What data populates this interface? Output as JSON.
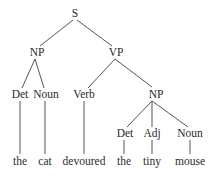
{
  "diagram": {
    "type": "syntax-tree",
    "nodes": {
      "s": {
        "label": "S",
        "x": 75,
        "y": 17
      },
      "np1": {
        "label": "NP",
        "x": 37,
        "y": 56
      },
      "vp": {
        "label": "VP",
        "x": 116,
        "y": 56
      },
      "det1": {
        "label": "Det",
        "x": 20,
        "y": 98
      },
      "noun1": {
        "label": "Noun",
        "x": 46,
        "y": 98
      },
      "verb": {
        "label": "Verb",
        "x": 84,
        "y": 98
      },
      "np2": {
        "label": "NP",
        "x": 156,
        "y": 98
      },
      "det2": {
        "label": "Det",
        "x": 125,
        "y": 137
      },
      "adj": {
        "label": "Adj",
        "x": 152,
        "y": 137
      },
      "noun2": {
        "label": "Noun",
        "x": 190,
        "y": 137
      }
    },
    "words": {
      "w1": {
        "label": "the",
        "x": 20,
        "y": 165
      },
      "w2": {
        "label": "cat",
        "x": 45,
        "y": 165
      },
      "w3": {
        "label": "devoured",
        "x": 84,
        "y": 165
      },
      "w4": {
        "label": "the",
        "x": 125,
        "y": 165
      },
      "w5": {
        "label": "tiny",
        "x": 152,
        "y": 165
      },
      "w6": {
        "label": "mouse",
        "x": 190,
        "y": 165
      }
    }
  }
}
